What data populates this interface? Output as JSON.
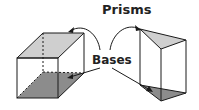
{
  "title": "Prisms",
  "label": "Bases",
  "colors": {
    "top_face": "#cfcfcf",
    "bottom_face": "#8c8c8c",
    "stroke": "#1a1a1a"
  },
  "shapes": [
    {
      "name": "rectangular-prism",
      "bases": [
        "top",
        "bottom"
      ]
    },
    {
      "name": "triangular-prism",
      "bases": [
        "top",
        "bottom"
      ]
    }
  ]
}
